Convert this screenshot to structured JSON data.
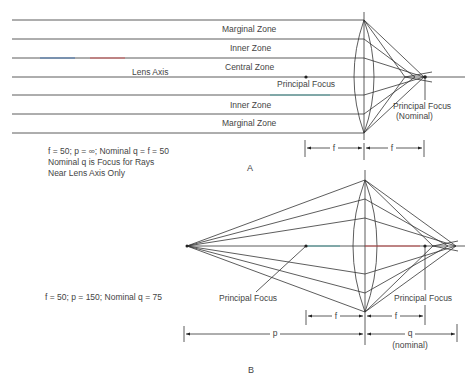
{
  "figure_a": {
    "caption": "A",
    "zones": {
      "marginal_top": "Marginal Zone",
      "inner_top": "Inner Zone",
      "central": "Central Zone",
      "inner_bottom": "Inner Zone",
      "marginal_bottom": "Marginal Zone"
    },
    "lens_axis_label": "Lens Axis",
    "principal_focus_label": "Principal Focus",
    "principal_focus_nominal_label": "Principal Focus",
    "nominal_label": "(Nominal)",
    "dimension_f1": "f",
    "dimension_f2": "f",
    "notes": [
      "f = 50; p = ∞; Nominal q = f = 50",
      "Nominal q is Focus for Rays",
      "Near Lens Axis Only"
    ]
  },
  "figure_b": {
    "caption": "B",
    "principal_focus_left_label": "Principal Focus",
    "principal_focus_right_label": "Principal Focus",
    "note": "f = 50; p = 150; Nominal q = 75",
    "dimension_f1": "f",
    "dimension_f2": "f",
    "dimension_p": "p",
    "dimension_q": "q",
    "dimension_q_sub": "(nominal)"
  }
}
